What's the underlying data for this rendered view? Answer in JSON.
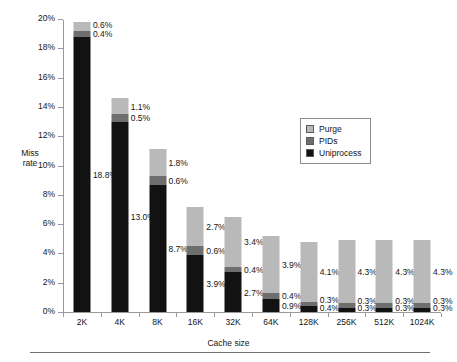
{
  "chart_data": {
    "type": "bar",
    "subtype": "stacked-bar",
    "title": "",
    "xlabel": "Cache size",
    "ylabel": "Miss rate",
    "ylabel_lines": [
      "Miss",
      "rate"
    ],
    "categories": [
      "2K",
      "4K",
      "8K",
      "16K",
      "32K",
      "64K",
      "128K",
      "256K",
      "512K",
      "1024K"
    ],
    "ylim": [
      0,
      20
    ],
    "yticks": [
      0,
      2,
      4,
      6,
      8,
      10,
      12,
      14,
      16,
      18,
      20
    ],
    "ytick_labels": [
      "0%",
      "2%",
      "4%",
      "6%",
      "8%",
      "10%",
      "12%",
      "14%",
      "16%",
      "18%",
      "20%"
    ],
    "yunit": "%",
    "grid": false,
    "legend_position": "upper-center-right",
    "series": [
      {
        "name": "Uniprocess",
        "color": "#121212",
        "values": [
          18.8,
          13.0,
          8.7,
          3.9,
          2.7,
          0.9,
          0.4,
          0.3,
          0.3,
          0.3
        ],
        "labels": [
          "18.8%",
          "13.0%",
          "8.7%",
          "3.9%",
          "2.7%",
          "0.9%",
          "0.4%",
          "0.3%",
          "0.3%",
          "0.3%"
        ]
      },
      {
        "name": "PIDs",
        "color": "#6e6e6e",
        "values": [
          0.4,
          0.5,
          0.6,
          0.6,
          0.4,
          0.4,
          0.3,
          0.3,
          0.3,
          0.3
        ],
        "labels": [
          "0.4%",
          "0.5%",
          "0.6%",
          "0.6%",
          "0.4%",
          "0.4%",
          "0.3%",
          "0.3%",
          "0.3%",
          "0.3%"
        ]
      },
      {
        "name": "Purge",
        "color": "#b9b9b9",
        "values": [
          0.6,
          1.1,
          1.8,
          2.7,
          3.4,
          3.9,
          4.1,
          4.3,
          4.3,
          4.3
        ],
        "labels": [
          "0.6%",
          "1.1%",
          "1.8%",
          "2.7%",
          "3.4%",
          "3.9%",
          "4.1%",
          "4.3%",
          "4.3%",
          "4.3%"
        ]
      }
    ],
    "totals": [
      19.8,
      14.6,
      11.1,
      7.2,
      6.5,
      5.2,
      4.8,
      4.9,
      4.9,
      4.9
    ]
  },
  "legend": {
    "items": [
      {
        "label": "Purge",
        "color": "#b9b9b9"
      },
      {
        "label": "PIDs",
        "color": "#6e6e6e"
      },
      {
        "label": "Uniprocess",
        "color": "#121212"
      }
    ]
  }
}
